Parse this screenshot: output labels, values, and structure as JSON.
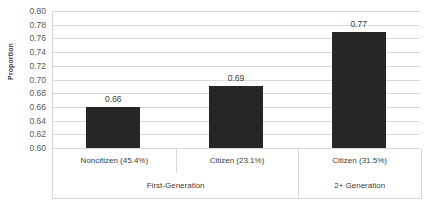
{
  "chart_data": {
    "type": "bar",
    "title": "",
    "xlabel": "",
    "ylabel": "Proportion",
    "ylim": [
      0.6,
      0.8
    ],
    "ytick_step": 0.02,
    "grid": true,
    "legend": "none",
    "bar_color": "#262626",
    "gridline_color": "#d9d9d9",
    "categories": [
      "Noncitizen (45.4%)",
      "Citizen (23.1%)",
      "Citizen (31.5%)"
    ],
    "values": [
      0.66,
      0.69,
      0.77
    ],
    "data_labels": [
      "0.66",
      "0.69",
      "0.77"
    ],
    "groups": [
      {
        "label": "First-Generation",
        "categories": [
          "Noncitizen (45.4%)",
          "Citizen (23.1%)"
        ]
      },
      {
        "label": "2+ Generation",
        "categories": [
          "Citizen (31.5%)"
        ]
      }
    ],
    "ytick_labels": [
      "0.80",
      "0.78",
      "0.76",
      "0.74",
      "0.72",
      "0.70",
      "0.68",
      "0.66",
      "0.64",
      "0.62",
      "0.60"
    ],
    "ytick_values": [
      0.8,
      0.78,
      0.76,
      0.74,
      0.72,
      0.7,
      0.68,
      0.66,
      0.64,
      0.62,
      0.6
    ]
  },
  "axis": {
    "y_title": "Proportion"
  },
  "group_labels": {
    "first": "First-Generation",
    "second": "2+ Generation"
  }
}
